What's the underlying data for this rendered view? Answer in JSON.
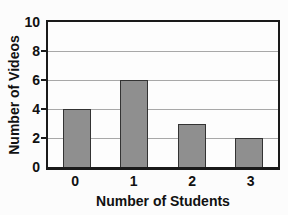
{
  "chart_data": {
    "type": "bar",
    "title": "",
    "categories": [
      "0",
      "1",
      "2",
      "3"
    ],
    "values": [
      4,
      6,
      3,
      2
    ],
    "xlabel": "Number of Students",
    "ylabel": "Number of Videos",
    "ylim": [
      0,
      10
    ],
    "yticks": [
      0,
      2,
      4,
      6,
      8,
      10
    ],
    "grid": true,
    "legend": "none",
    "colors": {
      "bar_fill": "#8f8f8f",
      "bar_border": "#333333",
      "gridline": "#a8a8a8",
      "frame": "#1a1a1a",
      "text": "#111111",
      "background": "#fcfcfc"
    }
  }
}
